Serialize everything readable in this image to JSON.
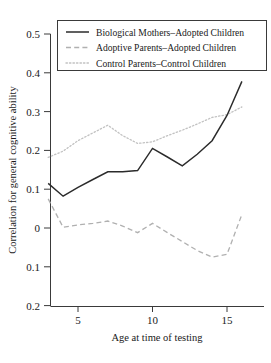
{
  "chart_data": {
    "type": "line",
    "title": "",
    "xlabel": "Age at time of testing",
    "ylabel": "Correlation for general cognitive ability",
    "xlim": [
      3,
      16
    ],
    "ylim": [
      -0.2,
      0.5
    ],
    "xticks": [
      5,
      10,
      15
    ],
    "xticklabels": [
      "5",
      "10",
      "15"
    ],
    "yticks": [
      0.5,
      0.4,
      0.3,
      0.2,
      0.1,
      0,
      -0.1,
      -0.2
    ],
    "yticklabels": [
      "0.5",
      "0.4",
      "0.3",
      "0.2",
      "0.1",
      "0",
      "0.1",
      "0.2"
    ],
    "grid": false,
    "legend_position": "top-center",
    "x": [
      3,
      4,
      5,
      6,
      7,
      8,
      9,
      10,
      11,
      12,
      13,
      14,
      15,
      16
    ],
    "series": [
      {
        "name": "Biological Mothers–Adopted Children",
        "style": "solid",
        "color": "#2b2b2b",
        "values": [
          0.115,
          0.082,
          0.105,
          0.125,
          0.145,
          0.145,
          0.148,
          0.205,
          0.183,
          0.16,
          0.19,
          0.225,
          0.29,
          0.378
        ]
      },
      {
        "name": "Adoptive Parents–Adopted Children",
        "style": "dashed",
        "color": "#b0b0b0",
        "values": [
          0.075,
          0.002,
          0.008,
          0.012,
          0.018,
          0.005,
          -0.012,
          0.012,
          -0.012,
          -0.035,
          -0.058,
          -0.075,
          -0.068,
          0.035
        ]
      },
      {
        "name": "Control Parents–Control Children",
        "style": "dotted",
        "color": "#c2c2c2",
        "values": [
          0.182,
          0.198,
          0.225,
          0.245,
          0.265,
          0.238,
          0.218,
          0.222,
          0.238,
          0.252,
          0.268,
          0.285,
          0.292,
          0.312
        ]
      }
    ]
  },
  "legend": {
    "items": [
      {
        "label": "Biological Mothers–Adopted Children"
      },
      {
        "label": "Adoptive Parents–Adopted Children"
      },
      {
        "label": "Control Parents–Control Children"
      }
    ]
  },
  "axes": {
    "y_title": "Correlation for general cognitive ability",
    "x_title": "Age at time of testing",
    "y_labels": [
      "0.5",
      "0.4",
      "0.3",
      "0.2",
      "0.1",
      "0",
      "0.1",
      "0.2"
    ],
    "x_labels": [
      "5",
      "10",
      "15"
    ]
  }
}
